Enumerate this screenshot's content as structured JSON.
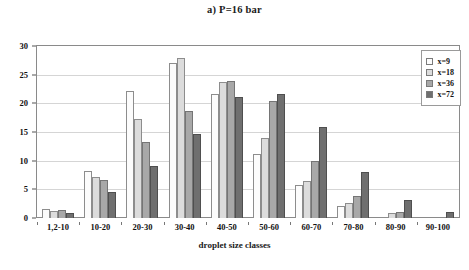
{
  "chart_data": {
    "type": "bar",
    "title": "a) P=16 bar",
    "xlabel": "droplet size classes",
    "ylabel": "%F",
    "ylabel_sub": "T",
    "ylim": [
      0,
      30
    ],
    "yticks": [
      0,
      5,
      10,
      15,
      20,
      25,
      30
    ],
    "grid": true,
    "legend_position": "top-right",
    "categories": [
      "1,2-10",
      "10-20",
      "20-30",
      "30-40",
      "40-50",
      "50-60",
      "60-70",
      "70-80",
      "80-90",
      "90-100"
    ],
    "series": [
      {
        "name": "x=9",
        "color": "#fcfcfc",
        "values": [
          1.6,
          8.2,
          22.1,
          27.0,
          21.7,
          11.2,
          5.8,
          2.1,
          0.2,
          0.0
        ]
      },
      {
        "name": "x=18",
        "color": "#dcdcdc",
        "values": [
          1.3,
          7.1,
          17.2,
          27.9,
          23.7,
          13.9,
          6.5,
          2.6,
          0.9,
          0.0
        ]
      },
      {
        "name": "x=36",
        "color": "#a8a8a8",
        "values": [
          1.4,
          6.6,
          13.3,
          18.6,
          23.9,
          20.4,
          10.0,
          3.9,
          1.1,
          0.0
        ]
      },
      {
        "name": "x=72",
        "color": "#6f6f6f",
        "values": [
          0.9,
          4.6,
          9.0,
          14.6,
          21.1,
          21.6,
          15.9,
          8.0,
          3.1,
          1.0
        ]
      }
    ]
  }
}
